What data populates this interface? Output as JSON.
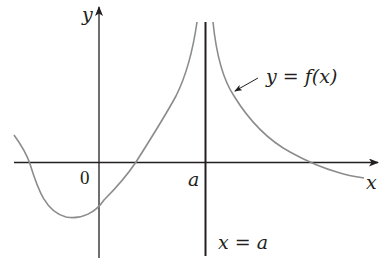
{
  "diagram": {
    "type": "function-graph-vertical-asymptote",
    "axes": {
      "x_label": "x",
      "y_label": "y",
      "origin_label": "0",
      "tick_label_a": "a"
    },
    "curve": {
      "label": "y = f(x)",
      "color": "#8c8c8c"
    },
    "asymptote": {
      "label": "x = a",
      "color": "#231f20"
    },
    "axis_color": "#231f20"
  }
}
